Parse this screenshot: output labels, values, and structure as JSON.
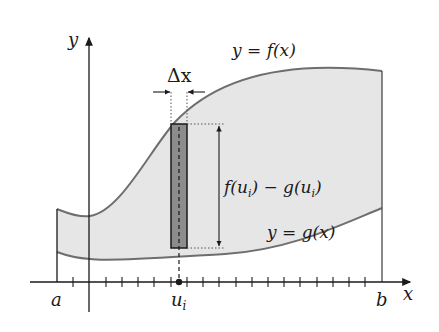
{
  "figure": {
    "type": "area-between-curves-diagram",
    "axis_labels": {
      "x": "x",
      "y": "y"
    },
    "curves": [
      {
        "name": "upper",
        "label": "y = f(x)"
      },
      {
        "name": "lower",
        "label": "y = g(x)"
      }
    ],
    "interval_labels": {
      "a": "a",
      "b": "b",
      "sample_point": "u",
      "sample_subscript": "i"
    },
    "width_label": "Δx",
    "height_label": "f(u_i) − g(u_i)",
    "height_label_parts": [
      "f(u",
      "i",
      ") − g(u",
      "i",
      ")"
    ],
    "colors": {
      "region_fill": "#e6e6e6",
      "rectangle_fill": "#8c8c8c",
      "curve_stroke": "#6e6e6e",
      "axis_stroke": "#1a1a1a"
    },
    "tick_count": 20
  }
}
